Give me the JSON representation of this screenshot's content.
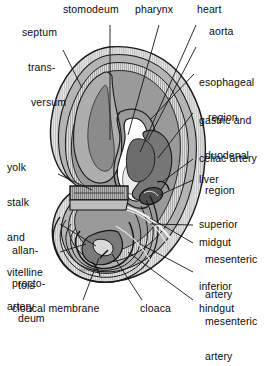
{
  "figure": {
    "signature": "Nelson",
    "palette": {
      "outline": "#1a1a1a",
      "hatch_light": "#d8d8d8",
      "band_light": "#cfcfcf",
      "band_mid": "#a8a8a8",
      "band_dark": "#8f8f8f",
      "gut_dark": "#6f6f6f",
      "gut_darker": "#565656",
      "lumen_white": "#ffffff",
      "lumen_cream": "#ececec",
      "background": "#ffffff",
      "leader": "#1a1a1a"
    }
  },
  "labels": {
    "septum_transversum": {
      "line1": "septum",
      "line2": "trans-",
      "line3": "versum"
    },
    "stomodeum": {
      "text": "stomodeum"
    },
    "pharynx": {
      "text": "pharynx"
    },
    "heart": {
      "text": "heart"
    },
    "aorta": {
      "text": "aorta"
    },
    "esophageal_region": {
      "line1": "esophageal",
      "line2": "region"
    },
    "gastric_duodenal_region": {
      "line1": "gastric and",
      "line2": "duodenal",
      "line3": "region"
    },
    "celiac_artery": {
      "text": "celiac artery"
    },
    "liver": {
      "text": "liver"
    },
    "superior_mesenteric_artery": {
      "line1": "superior",
      "line2": "mesenteric",
      "line3": "artery"
    },
    "midgut": {
      "text": "midgut"
    },
    "inferior_mesenteric_artery": {
      "line1": "inferior",
      "line2": "mesenteric",
      "line3": "artery"
    },
    "hindgut": {
      "text": "hindgut"
    },
    "cloaca": {
      "text": "cloaca"
    },
    "cloacal_membrane": {
      "text": "cloacal membrane"
    },
    "proctodeum": {
      "line1": "procto-",
      "line2": "deum"
    },
    "allantois": {
      "line1": "allan-",
      "line2": "tois"
    },
    "yolk_stalk_vitelline_artery": {
      "line1": "yolk",
      "line2": "stalk",
      "line3": "and",
      "line4": "vitelline",
      "line5": "artery"
    }
  }
}
